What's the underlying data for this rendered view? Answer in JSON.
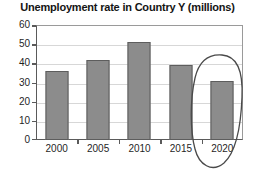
{
  "chart_data": {
    "type": "bar",
    "title": "Unemployment rate in Country Y (millions)",
    "xlabel": "",
    "ylabel": "",
    "categories": [
      "2000",
      "2005",
      "2010",
      "2015",
      "2020"
    ],
    "values": [
      36,
      42,
      51,
      39,
      31
    ],
    "series": [
      {
        "name": "Unemployment rate",
        "values": [
          36,
          42,
          51,
          39,
          31
        ]
      }
    ],
    "ylim": [
      0,
      60
    ],
    "yticks": [
      0,
      10,
      20,
      30,
      40,
      50,
      60
    ],
    "ytick_labels": [
      "0",
      "10",
      "20",
      "30",
      "40",
      "50",
      "60"
    ],
    "grid": true,
    "grid_axis": "y",
    "legend": false,
    "legend_position": "none",
    "bar_color": "#8c8c8c",
    "bar_edge_color": "#5d5d5d",
    "grid_color": "#d7d7d7",
    "axis_color": "#5a5a5a",
    "text_color": "#1f1f1f",
    "annotations": [
      {
        "type": "ellipse",
        "name": "highlight-ellipse-2020",
        "target_category": "2020",
        "color": "#4a4a4a",
        "style": "hand-drawn"
      }
    ]
  }
}
